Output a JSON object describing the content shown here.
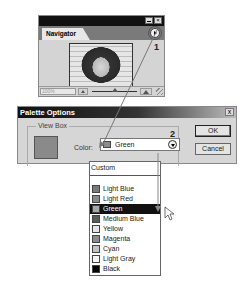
{
  "navigator": {
    "tab_label": "Navigator",
    "zoom_value": "100%",
    "callout_number": "1",
    "menu_icon": "palette-menu-arrow-icon"
  },
  "dialog": {
    "title": "Palette Options",
    "close_label": "x",
    "group_label": "View Box",
    "color_label": "Color:",
    "selected_color": "Green",
    "selected_color_swatch": "#8c8c8c",
    "callout_number": "2",
    "ok_label": "OK",
    "cancel_label": "Cancel"
  },
  "dropdown": {
    "custom_label": "Custom",
    "items": [
      {
        "label": "Light Blue",
        "swatch": "#7a7a7a",
        "selected": false
      },
      {
        "label": "Light Red",
        "swatch": "#8a8a8a",
        "selected": false
      },
      {
        "label": "Green",
        "swatch": "#a8a8a8",
        "selected": true
      },
      {
        "label": "Medium Blue",
        "swatch": "#5a5a5a",
        "selected": false
      },
      {
        "label": "Yellow",
        "swatch": "#e4e4e4",
        "selected": false
      },
      {
        "label": "Magenta",
        "swatch": "#8c8c8c",
        "selected": false
      },
      {
        "label": "Cyan",
        "swatch": "#c4c4c4",
        "selected": false
      },
      {
        "label": "Light Gray",
        "swatch": "#f6f6f6",
        "selected": false
      },
      {
        "label": "Black",
        "swatch": "#000000",
        "selected": false
      }
    ]
  }
}
